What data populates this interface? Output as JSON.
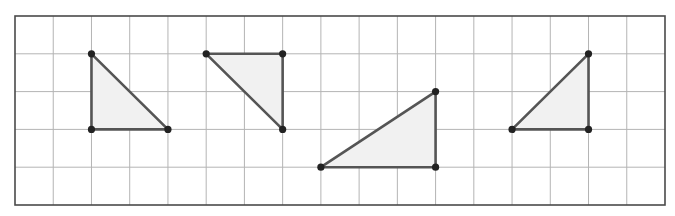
{
  "diagram": {
    "type": "grid-with-triangles",
    "grid": {
      "columns": 17,
      "rows": 5,
      "origin_px": [
        15,
        16
      ],
      "cell_w": 38.235,
      "cell_h": 37.8,
      "line_color": "#b4b4b4",
      "border_color": "#4a4a4a"
    },
    "style": {
      "edge_color": "#555555",
      "fill_color": "#f1f1f1",
      "vertex_color": "#222222",
      "vertex_radius": 3.6,
      "edge_width": 2.6
    },
    "triangles": [
      {
        "name": "triangle-1",
        "vertices": [
          [
            2,
            1
          ],
          [
            2,
            3
          ],
          [
            4,
            3
          ]
        ]
      },
      {
        "name": "triangle-2",
        "vertices": [
          [
            5,
            1
          ],
          [
            7,
            1
          ],
          [
            7,
            3
          ]
        ]
      },
      {
        "name": "triangle-3",
        "vertices": [
          [
            8,
            4
          ],
          [
            11,
            4
          ],
          [
            11,
            2
          ]
        ]
      },
      {
        "name": "triangle-4",
        "vertices": [
          [
            13,
            3
          ],
          [
            15,
            3
          ],
          [
            15,
            1
          ]
        ]
      }
    ]
  }
}
